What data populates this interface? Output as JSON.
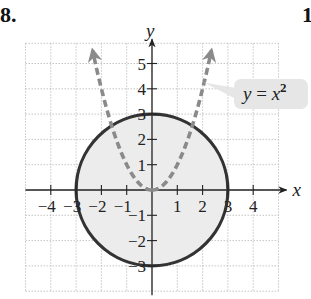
{
  "problem": {
    "number_label": "8.",
    "next_number_label": "1"
  },
  "graph": {
    "x_axis_label": "x",
    "y_axis_label": "y",
    "x_tick_labels": [
      "−4",
      "−3",
      "−2",
      "−1",
      "1",
      "2",
      "3",
      "4"
    ],
    "x_tick_values": [
      -4,
      -3,
      -2,
      -1,
      1,
      2,
      3,
      4
    ],
    "y_tick_labels": [
      "5",
      "4",
      "3",
      "2",
      "1",
      "−1",
      "−2",
      "−3"
    ],
    "y_tick_values": [
      5,
      4,
      3,
      2,
      1,
      -1,
      -2,
      -3
    ],
    "equation_label": {
      "lhs": "y = x",
      "exponent": "2"
    },
    "colors": {
      "grid": "#b8b8b8",
      "axis": "#222222",
      "circle_stroke": "#333333",
      "circle_fill": "#ececec",
      "parabola": "#8a8a8a",
      "callout_bg": "#e6e6e6"
    }
  },
  "chart_data": {
    "type": "diagram",
    "title": "",
    "xlabel": "x",
    "ylabel": "y",
    "xlim": [
      -5,
      5
    ],
    "ylim": [
      -4,
      5.8
    ],
    "grid": true,
    "curves": [
      {
        "name": "circle",
        "equation": "x^2 + y^2 = 9",
        "center": [
          0,
          0
        ],
        "radius": 3,
        "style": "solid",
        "fill": "shaded interior"
      },
      {
        "name": "parabola",
        "equation": "y = x^2",
        "label": "y = x²",
        "style": "dashed",
        "arrows": "both ends",
        "x_range": [
          -2.35,
          2.35
        ]
      }
    ],
    "x_ticks": [
      -4,
      -3,
      -2,
      -1,
      1,
      2,
      3,
      4
    ],
    "y_ticks": [
      -3,
      -2,
      -1,
      1,
      2,
      3,
      4,
      5
    ]
  }
}
